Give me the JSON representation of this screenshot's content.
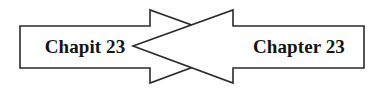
{
  "figure": {
    "name": "bidirectional-crossing-arrows-diagram",
    "background_color": "#ffffff",
    "line_color": "#2b2b2b",
    "text_color": "#141414",
    "width": 383,
    "height": 92
  },
  "left_arrow": {
    "label": "Chapit 23",
    "direction": "right",
    "fill_color": "#ffffff",
    "stroke_color": "#2b2b2b"
  },
  "right_arrow": {
    "label": "Chapter 23",
    "direction": "left",
    "fill_color": "#ffffff",
    "stroke_color": "#2b2b2b"
  }
}
